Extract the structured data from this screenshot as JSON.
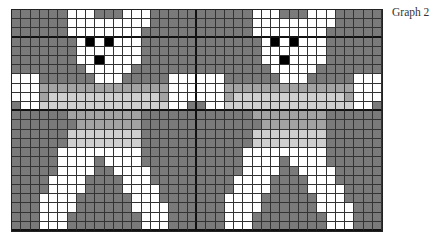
{
  "label": "Graph 2",
  "grid": {
    "columns": 40,
    "rows": 24,
    "tile_columns": 20,
    "tile_repeat": 2,
    "thick_line_every_col": 20,
    "thick_line_rows": [
      2,
      10,
      23
    ],
    "colors": {
      "D": "#7a7a7a",
      "M": "#a3a3a3",
      "L": "#cfcfcf",
      "W": "#ffffff",
      "B": "#000000"
    },
    "tile_rows": [
      "DDDDDDWWWDDDWWWDDDDD",
      "DDDDDDWWWWWWWWWDDDDD",
      "DDDDDDWWWWWWWWDDDDDD",
      "DDDDDDDWBWBWWWDDDDDD",
      "DDDDDDDWWWWWWWDDDDDD",
      "DDDDDDDWWBWWWWDDDDDD",
      "DDDDDDDDWWWWWDDDDDDD",
      "WWWDDDDDDWWWDDDDDWWW",
      "WWWMMMMMMMMMMMMMMWWW",
      "WWWMLLLLLLLLLLLLMWWW",
      "DWWLLLLLLLLLLLLLLWWD",
      "DDDDDDMMMMMMMMDDDDDD",
      "DDDDDDDMMMMMMMDDDDDD",
      "DDDDDDLLLLLLLLDDDDDD",
      "DDDDDDLLLLLLLLDDDDDD",
      "DDDDDWWWWWWWWWDDDDDD",
      "DDDDDWWWWDWWWWDDDDDD",
      "DDDDDWWWWDDWWWWDDDDD",
      "DDDDWWWWDDDDWWWDDDDD",
      "DDDDWWWWDDDDWWWWDDDD",
      "DDDWWWWDDDDDDWWWDDDD",
      "DDDWWWWDDDDDDWWWWDDD",
      "DDDWWWDDDDDDDDWWWDDD",
      "DDDWWWDDDDDDDDWWWDDD"
    ]
  }
}
